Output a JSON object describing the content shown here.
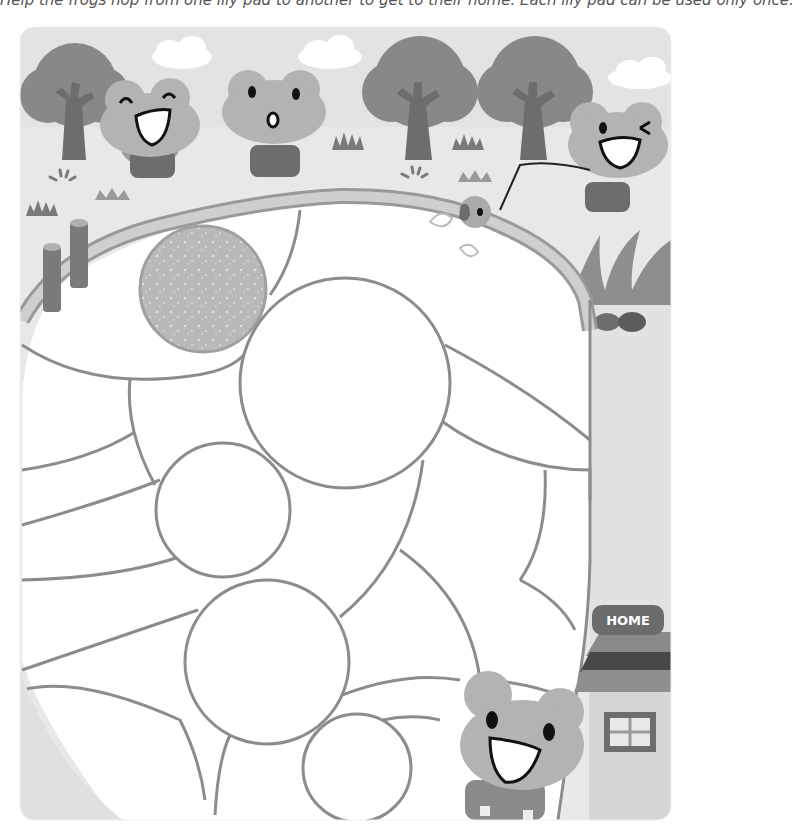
{
  "page": {
    "instruction_text": "Help the frogs hop from one lily pad to another to get to their home. Each lily pad can be used only once.",
    "home_sign_label": "HOME"
  },
  "colors": {
    "sky": "#e6e6e6",
    "ground": "#e9e9e9",
    "tree_canopy": "#8a8a8a",
    "tree_trunk": "#6e6e6e",
    "frog_body": "#b3b3b3",
    "path_stroke": "#8c8c8c",
    "lily_pad_fill": "#ffffff",
    "start_pad_fill": "#b8b8b8",
    "sign_bg": "#6b6b6b",
    "sign_text": "#ffffff",
    "roof_dark": "#474747",
    "roof_mid": "#8a8a8a",
    "house_wall": "#d4d4d4"
  },
  "scene": {
    "characters": [
      {
        "name": "frog-laughing",
        "expression": "laughing"
      },
      {
        "name": "frog-surprised",
        "expression": "surprised"
      },
      {
        "name": "frog-winking-fishing",
        "expression": "winking"
      },
      {
        "name": "frog-bottom-smiling",
        "expression": "smiling"
      },
      {
        "name": "small-fish-on-line",
        "expression": "closed-eyes"
      }
    ],
    "pond": {
      "start_pad": "textured lily pad (start)",
      "lily_pads_count": 6,
      "goal": "HOME"
    }
  }
}
